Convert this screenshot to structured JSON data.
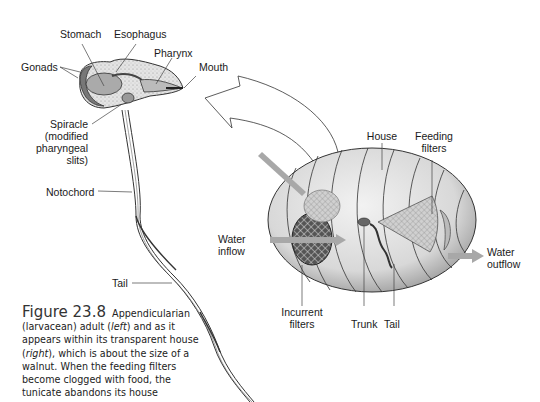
{
  "figure": {
    "number": "Figure 23.8",
    "caption_parts": {
      "p1": "Appendicularian (larvacean) adult (",
      "left": "left",
      "p2": ") and as it appears within its transparent house (",
      "right": "right",
      "p3": "), which is about the size of a walnut. When the feeding filters become clogged with food, the tunicate abandons its house"
    }
  },
  "left_labels": {
    "stomach": "Stomach",
    "esophagus": "Esophagus",
    "pharynx": "Pharynx",
    "gonads": "Gonads",
    "mouth": "Mouth",
    "spiracle_1": "Spiracle",
    "spiracle_2": "(modified",
    "spiracle_3": "pharyngeal",
    "spiracle_4": "slits)",
    "notochord": "Notochord",
    "tail": "Tail"
  },
  "right_labels": {
    "house": "House",
    "feeding_1": "Feeding",
    "feeding_2": "filters",
    "water_in_1": "Water",
    "water_in_2": "inflow",
    "water_out_1": "Water",
    "water_out_2": "outflow",
    "incurrent_1": "Incurrent",
    "incurrent_2": "filters",
    "trunk": "Trunk",
    "tail": "Tail"
  },
  "colors": {
    "flow_arrow": "#a8a8a8",
    "body_fill": "#d9d9d9",
    "house_fill": "#e6e6e6",
    "line": "#333333"
  }
}
